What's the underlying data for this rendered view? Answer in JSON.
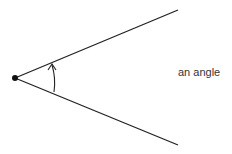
{
  "diagram": {
    "title": "",
    "label": "an angle",
    "elements": [
      {
        "id": "vertex",
        "type": "point",
        "description": "vertex of the angle"
      },
      {
        "id": "upper-ray",
        "type": "ray"
      },
      {
        "id": "lower-ray",
        "type": "ray"
      },
      {
        "id": "angle-arc",
        "type": "arc-arrow",
        "direction": "counterclockwise"
      }
    ],
    "colors": {
      "stroke": "#222222",
      "text": "#333333"
    }
  }
}
